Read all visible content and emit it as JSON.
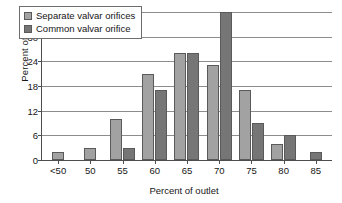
{
  "chart_data": {
    "type": "bar",
    "title": "",
    "xlabel": "Percent of outlet",
    "ylabel": "Percent of cases",
    "categories": [
      "<50",
      "50",
      "55",
      "60",
      "65",
      "70",
      "75",
      "80",
      "85"
    ],
    "series": [
      {
        "name": "Separate valvar orifices",
        "color": "#a2a2a2",
        "values": [
          2,
          3,
          10,
          21,
          26,
          23,
          17,
          4,
          0
        ]
      },
      {
        "name": "Common valvar orifice",
        "color": "#767676",
        "values": [
          0,
          0,
          3,
          17,
          26,
          36,
          9,
          6,
          2
        ]
      }
    ],
    "ylim": [
      0,
      36
    ],
    "yticks": [
      0,
      6,
      12,
      18,
      24,
      30,
      36
    ],
    "ytick_labels": [
      "0",
      "6",
      "12",
      "18",
      "24",
      "30",
      "36"
    ],
    "grid": true,
    "legend_position": "upper-left"
  }
}
